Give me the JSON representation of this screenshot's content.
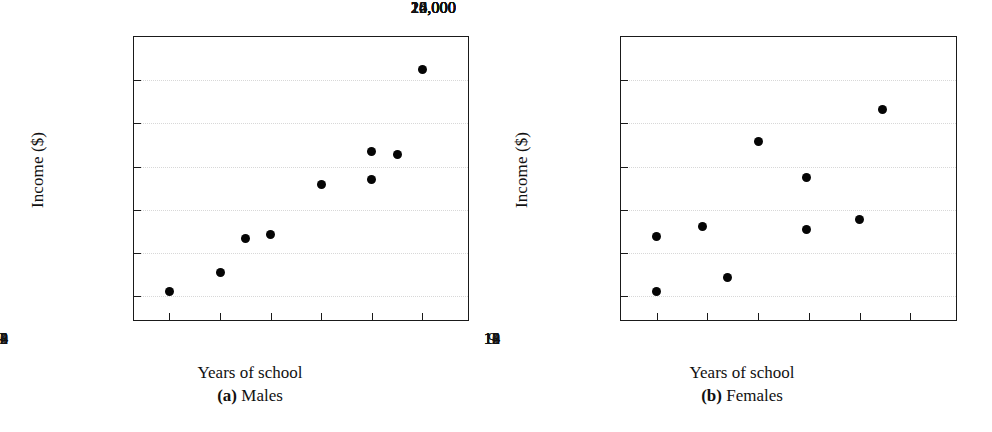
{
  "figure": {
    "background": "#ffffff",
    "marker_color": "#050505",
    "axis_color": "#1a1a1a",
    "grid_color": "#d8d8d8"
  },
  "chart_data": [
    {
      "type": "scatter",
      "panel_letter": "(a)",
      "panel_name": "Males",
      "title": "",
      "xlabel": "Years of school",
      "ylabel": "Income ($)",
      "xlim": [
        8.3,
        14.9
      ],
      "ylim": [
        12900,
        26000
      ],
      "xticks": [
        9,
        10,
        11,
        12,
        13,
        14
      ],
      "xticklabels": [
        "9",
        "10",
        "11",
        "12",
        "13",
        "14"
      ],
      "yticks": [
        14000,
        16000,
        18000,
        20000,
        22000,
        24000,
        26000
      ],
      "yticklabels": [
        "14,000",
        "16,000",
        "18,000",
        "20,000",
        "22,000",
        "24,000",
        "26,000"
      ],
      "grid": true,
      "legend": "none",
      "points": [
        {
          "x": 9.0,
          "y": 14200
        },
        {
          "x": 10.0,
          "y": 15100
        },
        {
          "x": 10.5,
          "y": 16650
        },
        {
          "x": 11.0,
          "y": 16850
        },
        {
          "x": 12.0,
          "y": 19150
        },
        {
          "x": 13.0,
          "y": 20700
        },
        {
          "x": 13.0,
          "y": 19400
        },
        {
          "x": 13.5,
          "y": 20550
        },
        {
          "x": 14.0,
          "y": 24500
        }
      ]
    },
    {
      "type": "scatter",
      "panel_letter": "(b)",
      "panel_name": "Females",
      "title": "",
      "xlabel": "Years of school",
      "ylabel": "Income ($)",
      "xlim": [
        8.3,
        14.9
      ],
      "ylim": [
        12900,
        26000
      ],
      "xticks": [
        9,
        10,
        11,
        12,
        13,
        14
      ],
      "xticklabels": [
        "9",
        "10",
        "11",
        "12",
        "13",
        "14"
      ],
      "yticks": [
        14000,
        16000,
        18000,
        20000,
        22000,
        24000,
        26000
      ],
      "yticklabels": [
        "14,000",
        "16,000",
        "18,000",
        "20,000",
        "22,000",
        "24,000",
        "26,000"
      ],
      "grid": true,
      "legend": "none",
      "points": [
        {
          "x": 9.0,
          "y": 16750
        },
        {
          "x": 9.0,
          "y": 14200
        },
        {
          "x": 9.9,
          "y": 17250
        },
        {
          "x": 10.4,
          "y": 14850
        },
        {
          "x": 11.0,
          "y": 21150
        },
        {
          "x": 11.95,
          "y": 19500
        },
        {
          "x": 11.95,
          "y": 17100
        },
        {
          "x": 13.0,
          "y": 17550
        },
        {
          "x": 13.45,
          "y": 22650
        }
      ]
    }
  ]
}
